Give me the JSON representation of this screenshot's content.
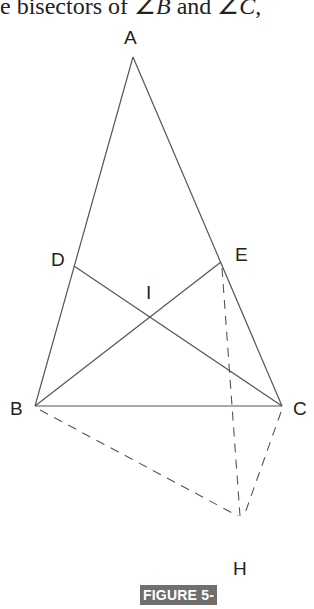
{
  "header_text": {
    "prefix": "e bisectors of ",
    "angle1": "∠B",
    "middle": " and ",
    "angle2": "∠C",
    "suffix": ","
  },
  "diagram": {
    "points": {
      "A": {
        "label": "A",
        "x": 133,
        "y": 57
      },
      "B": {
        "label": "B",
        "x": 35,
        "y": 406
      },
      "C": {
        "label": "C",
        "x": 282,
        "y": 406
      },
      "D": {
        "label": "D",
        "x": 74,
        "y": 266
      },
      "E": {
        "label": "E",
        "x": 221,
        "y": 262
      },
      "I": {
        "label": "I",
        "x": 150,
        "y": 317
      },
      "H": {
        "label": "H",
        "x": 241,
        "y": 518
      }
    },
    "solid_segments": [
      "AB",
      "AC",
      "BC",
      "BE",
      "CD"
    ],
    "dashed_segments": [
      "BH",
      "EH",
      "CH"
    ],
    "line_color": "#555555"
  },
  "figure_label": "FIGURE 5-5"
}
